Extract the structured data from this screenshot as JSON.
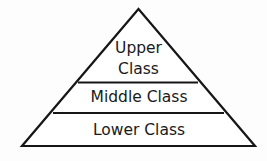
{
  "diagram": {
    "name": "social-class-pyramid",
    "type": "pyramid",
    "background_color": "#fdfdfd",
    "stroke_color": "#161616",
    "fill_color": "#ffffff",
    "stroke_width": 2.2,
    "geometry": {
      "apex": {
        "x": 138.5,
        "y": 9
      },
      "bottom_left": {
        "x": 22,
        "y": 146
      },
      "bottom_right": {
        "x": 255,
        "y": 146
      },
      "dividers": [
        {
          "y": 82.5,
          "x1": 78,
          "x2": 198
        },
        {
          "y": 113,
          "x1": 53,
          "x2": 224
        }
      ]
    },
    "tiers": [
      {
        "id": "upper",
        "lines": [
          "Upper",
          "Class"
        ],
        "line1": "Upper",
        "line2": "Class",
        "label_x": 138.5,
        "line1_y": 48,
        "line2_y": 69.5
      },
      {
        "id": "middle",
        "label": "Middle Class",
        "label_x": 139,
        "label_y": 97.5
      },
      {
        "id": "lower",
        "label": "Lower Class",
        "label_x": 139,
        "label_y": 130
      }
    ]
  }
}
